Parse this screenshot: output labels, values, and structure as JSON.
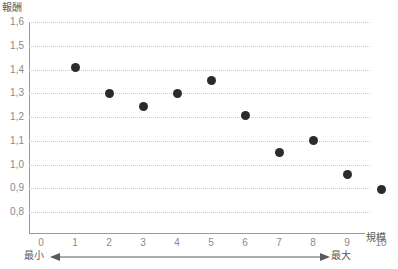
{
  "chart_data": {
    "type": "scatter",
    "title": "",
    "subtitle": "",
    "xlabel": "規模",
    "ylabel": "報酬",
    "x": [
      1,
      2,
      3,
      4,
      5,
      6,
      7,
      8,
      9,
      10
    ],
    "values": [
      1.41,
      1.3,
      1.245,
      1.298,
      1.355,
      1.205,
      1.05,
      1.1,
      0.96,
      0.895
    ],
    "series": [
      {
        "name": "報酬",
        "values": [
          1.41,
          1.3,
          1.245,
          1.298,
          1.355,
          1.205,
          1.05,
          1.1,
          0.96,
          0.895
        ]
      }
    ],
    "xlim": [
      0,
      10.6
    ],
    "ylim": [
      0.73,
      1.6
    ],
    "ytick_labels": [
      "1,6",
      "1,5",
      "1,4",
      "1,3",
      "1,2",
      "1,1",
      "1,0",
      "0,9",
      "0,8"
    ],
    "ytick_values": [
      1.6,
      1.5,
      1.4,
      1.3,
      1.2,
      1.1,
      1.0,
      0.9,
      0.8
    ],
    "xtick_labels": [
      "0",
      "1",
      "2",
      "3",
      "4",
      "5",
      "6",
      "7",
      "8",
      "9",
      "10"
    ],
    "xtick_values": [
      0,
      1,
      2,
      3,
      4,
      5,
      6,
      7,
      8,
      9,
      10
    ],
    "grid": "horizontal-dotted",
    "legend": "none",
    "marker_color": "#2b2b2b",
    "grid_color": "#c9c9c9",
    "axis_color": "#9a9a9a",
    "text_color": "#808080",
    "annotations": {
      "left_label": "最小",
      "right_label": "最大",
      "arrow": "double-headed"
    }
  }
}
